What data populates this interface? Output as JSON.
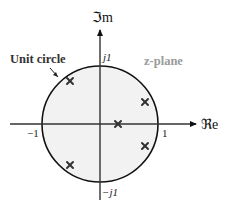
{
  "diagram": {
    "title": "z-plane",
    "labels": {
      "unit_circle": "Unit circle",
      "z_plane": "z-plane",
      "imag_axis": "ℑm",
      "real_axis": "ℜe",
      "tick_pos_real": "1",
      "tick_neg_real": "−1",
      "tick_pos_imag": "j1",
      "tick_neg_imag": "−j1"
    },
    "colors": {
      "circle_fill": "#f2f2f2",
      "stroke": "#111111",
      "z_plane_label": "#9a9a9a"
    },
    "geometry": {
      "center": [
        100,
        124
      ],
      "radius": 58
    },
    "markers": {
      "type": "pole",
      "symbol": "×",
      "points": [
        {
          "re": -0.52,
          "im": 0.76
        },
        {
          "re": 0.78,
          "im": 0.38
        },
        {
          "re": 0.31,
          "im": 0.0
        },
        {
          "re": 0.78,
          "im": -0.38
        },
        {
          "re": -0.52,
          "im": -0.71
        }
      ]
    }
  }
}
